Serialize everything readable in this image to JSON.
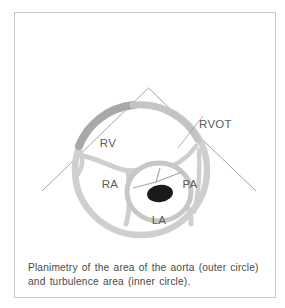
{
  "figure": {
    "type": "anatomical-diagram",
    "caption": {
      "line1": "Planimetry of the area of the aorta (outer circle)",
      "line2": "and turbulence area (inner circle)."
    },
    "labels": [
      {
        "id": "rv",
        "text": "RV",
        "meaning": "right ventricle",
        "x": 108,
        "y": 147
      },
      {
        "id": "rvot",
        "text": "RVOT",
        "meaning": "right ventricular outflow tract",
        "x": 199,
        "y": 128
      },
      {
        "id": "ra",
        "text": "RA",
        "meaning": "right atrium",
        "x": 110,
        "y": 188
      },
      {
        "id": "pa",
        "text": "PA",
        "meaning": "pulmonary artery",
        "x": 190,
        "y": 188
      },
      {
        "id": "la",
        "text": "LA",
        "meaning": "left atrium",
        "x": 159,
        "y": 224
      }
    ],
    "colors": {
      "frame_border": "#c9c9c9",
      "wall_light_gray": "#cfcfcf",
      "wall_mid_gray": "#bdbdbd",
      "wall_dark_gray": "#a8a8a8",
      "chamber_fill": "#ffffff",
      "turbulence_fill": "#1a1a1a",
      "sector_line": "#8d8d8d",
      "leader_line": "#9a9a9a",
      "label_text": "#5c5c5c",
      "caption_text": "#4a4a4a",
      "page_background": "#ffffff"
    },
    "elements": {
      "outer_circle_name": "aorta outer circle (planimetered area)",
      "inner_circle_name": "turbulence area (inner circle)",
      "sector_name": "ultrasound sector scan lines",
      "leader_name": "RVOT leader line"
    }
  }
}
